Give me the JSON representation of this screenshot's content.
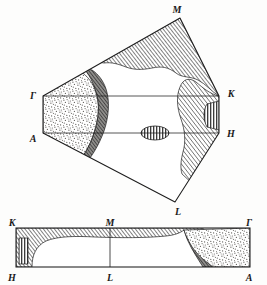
{
  "figure": {
    "type": "physics-diagram",
    "background_color": "#fdfdfc",
    "line_color": "#1d1d1d",
    "colors": {
      "outline": "#1d1d1d",
      "hatch_dark": "#4a4a4a",
      "crescent_fill": "#6e6e6e",
      "stipple_fill": "#d6d4cf",
      "stripe_fill": "#ffffff",
      "white_region": "#ffffff"
    }
  },
  "panels": [
    {
      "id": "top-panel",
      "name": "perspective-zone-face",
      "description": "Hexagonal Brillouin zone face drawn in perspective with Fermi surface regions",
      "vertices": [
        {
          "label": "M",
          "x": 180,
          "y": 18
        },
        {
          "label": "Gamma",
          "x": 43,
          "y": 96
        },
        {
          "label": "A",
          "x": 43,
          "y": 133
        },
        {
          "label": "L",
          "x": 175,
          "y": 202
        },
        {
          "label": "K",
          "x": 219,
          "y": 96
        },
        {
          "label": "H",
          "x": 219,
          "y": 133
        }
      ],
      "labels": [
        {
          "text": "M",
          "x": 177,
          "y": 12,
          "anchor": "middle"
        },
        {
          "text": "Γ",
          "x": 33,
          "y": 96,
          "anchor": "middle"
        },
        {
          "text": "A",
          "x": 33,
          "y": 140,
          "anchor": "middle"
        },
        {
          "text": "K",
          "x": 230,
          "y": 95,
          "anchor": "middle"
        },
        {
          "text": "H",
          "x": 230,
          "y": 135,
          "anchor": "middle"
        },
        {
          "text": "L",
          "x": 177,
          "y": 213,
          "anchor": "middle"
        }
      ],
      "features": [
        {
          "name": "stipple-lens-left",
          "fill": "stipple",
          "side": "left"
        },
        {
          "name": "crescent-dark-left",
          "fill": "crescent",
          "side": "left"
        },
        {
          "name": "hatch-cap-top",
          "fill": "hatch",
          "side": "top"
        },
        {
          "name": "hatch-lobe-right",
          "fill": "hatch",
          "side": "right"
        },
        {
          "name": "stripe-patch-right",
          "fill": "stripe",
          "side": "right"
        },
        {
          "name": "stripe-ellipse-center",
          "fill": "stripe",
          "side": "center",
          "cx": 155,
          "cy": 133,
          "rx": 14,
          "ry": 7
        }
      ]
    },
    {
      "id": "bottom-panel",
      "name": "side-view-zone-strip",
      "description": "Rectangular side view of the zone with Fermi surface regions",
      "rect": {
        "x": 16,
        "y": 228,
        "width": 234,
        "height": 39
      },
      "midline_x": 110,
      "labels": [
        {
          "text": "K",
          "x": 13,
          "y": 224,
          "anchor": "middle"
        },
        {
          "text": "M",
          "x": 110,
          "y": 224,
          "anchor": "middle"
        },
        {
          "text": "Γ",
          "x": 249,
          "y": 224,
          "anchor": "middle"
        },
        {
          "text": "H",
          "x": 13,
          "y": 279,
          "anchor": "middle"
        },
        {
          "text": "L",
          "x": 110,
          "y": 279,
          "anchor": "middle"
        },
        {
          "text": "A",
          "x": 249,
          "y": 279,
          "anchor": "middle"
        }
      ],
      "features": [
        {
          "name": "hatch-band-top",
          "fill": "hatch"
        },
        {
          "name": "stripe-patch-left",
          "fill": "stripe"
        },
        {
          "name": "crescent-dark-right",
          "fill": "crescent"
        },
        {
          "name": "stipple-block-right",
          "fill": "stipple"
        }
      ]
    }
  ]
}
